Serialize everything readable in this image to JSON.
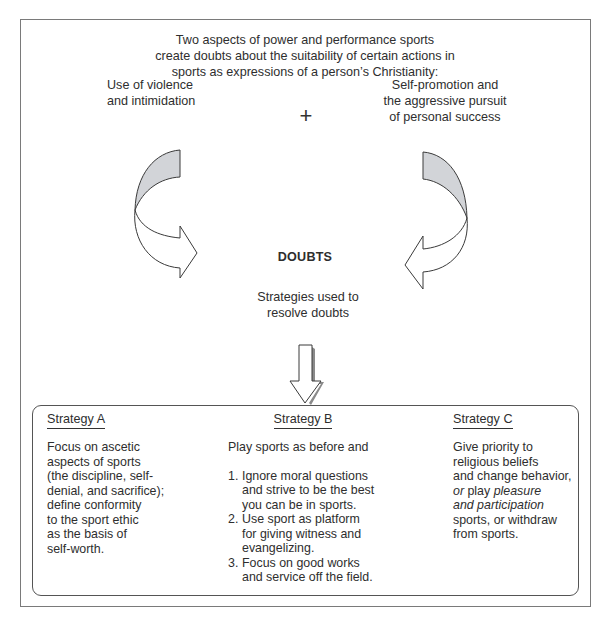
{
  "diagram": {
    "intro_lines": [
      "Two aspects of power and performance sports",
      "create doubts about the suitability of certain actions in",
      "sports as expressions of a person’s Christianity:"
    ],
    "left_aspect_lines": [
      "Use of violence",
      "and intimidation"
    ],
    "plus_symbol": "+",
    "right_aspect_lines": [
      "Self-promotion and",
      "the aggressive pursuit",
      "of personal success"
    ],
    "center_label": "DOUBTS",
    "strategies_label_lines": [
      "Strategies used to",
      "resolve doubts"
    ],
    "strategies": [
      {
        "title": "Strategy A",
        "body_lines": [
          "Focus on ascetic",
          "aspects of sports",
          "(the discipline, self-",
          "denial, and sacrifice);",
          "define conformity",
          "to the sport ethic",
          "as the basis of",
          "self-worth."
        ]
      },
      {
        "title": "Strategy B",
        "intro": "Play sports as before and",
        "items": [
          {
            "num": "1.",
            "lines": [
              "Ignore moral questions",
              "and strive to be the best",
              "you can be in sports."
            ]
          },
          {
            "num": "2.",
            "lines": [
              "Use sport as platform",
              "for giving witness and",
              "evangelizing."
            ]
          },
          {
            "num": "3.",
            "lines": [
              "Focus on good works",
              "and service off the field."
            ]
          }
        ]
      },
      {
        "title": "Strategy C",
        "body": {
          "line1": "Give priority to",
          "line2": "religious beliefs",
          "line3": "and change behavior,",
          "line4_a": "or",
          "line4_b": " play ",
          "line4_c": "pleasure",
          "line5": "and participation",
          "line6": "sports, or withdraw",
          "line7": "from sports."
        }
      }
    ],
    "colors": {
      "text": "#2e2e2e",
      "border": "#7a7a7a",
      "arrow_fill_gray": "#d2d4d8",
      "arrow_stroke": "#3a3a3a"
    }
  }
}
